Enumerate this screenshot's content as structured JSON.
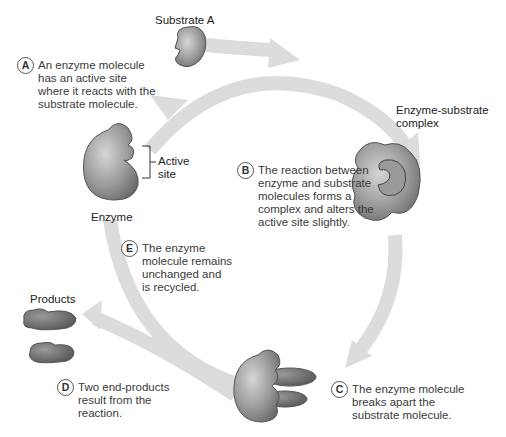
{
  "labels": {
    "substrate": "Substrate A",
    "complex": "Enzyme-substrate\ncomplex",
    "active_site": "Active\nsite",
    "enzyme": "Enzyme",
    "products": "Products"
  },
  "steps": [
    {
      "letter": "A",
      "text": "An enzyme molecule\nhas an active site\nwhere it reacts with the\nsubstrate molecule."
    },
    {
      "letter": "B",
      "text": "The reaction between\nenzyme and substrate\nmolecules forms a\ncomplex and alters the\nactive site slightly."
    },
    {
      "letter": "C",
      "text": "The enzyme molecule\nbreaks apart the\nsubstrate molecule."
    },
    {
      "letter": "D",
      "text": "Two end-products\nresult from the\nreaction."
    },
    {
      "letter": "E",
      "text": "The enzyme\nmolecule remains\nunchanged and\nis recycled."
    }
  ],
  "colors": {
    "arrow": "#d9d9d9",
    "molecule_dark": "#6e6e6e",
    "molecule_light": "#c8c8c8",
    "outline": "#444444"
  }
}
